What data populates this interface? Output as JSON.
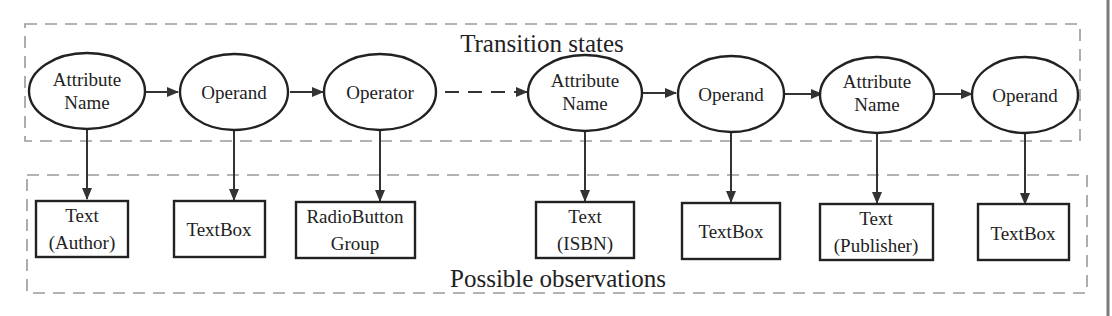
{
  "diagram": {
    "groups": {
      "transition": {
        "title": "Transition states"
      },
      "observation": {
        "title": "Possible observations"
      }
    },
    "states": [
      {
        "id": "s1",
        "lines": [
          "Attribute",
          "Name"
        ]
      },
      {
        "id": "s2",
        "lines": [
          "Operand"
        ]
      },
      {
        "id": "s3",
        "lines": [
          "Operator"
        ]
      },
      {
        "id": "s4",
        "lines": [
          "Attribute",
          "Name"
        ]
      },
      {
        "id": "s5",
        "lines": [
          "Operand"
        ]
      },
      {
        "id": "s6",
        "lines": [
          "Attribute",
          "Name"
        ]
      },
      {
        "id": "s7",
        "lines": [
          "Operand"
        ]
      }
    ],
    "observations": [
      {
        "id": "o1",
        "lines": [
          "Text",
          "(Author)"
        ]
      },
      {
        "id": "o2",
        "lines": [
          "TextBox"
        ]
      },
      {
        "id": "o3",
        "lines": [
          "RadioButton",
          "Group"
        ]
      },
      {
        "id": "o4",
        "lines": [
          "Text",
          "(ISBN)"
        ]
      },
      {
        "id": "o5",
        "lines": [
          "TextBox"
        ]
      },
      {
        "id": "o6",
        "lines": [
          "Text",
          "(Publisher)"
        ]
      },
      {
        "id": "o7",
        "lines": [
          "TextBox"
        ]
      }
    ],
    "transitions": [
      {
        "from": "s1",
        "to": "s2",
        "style": "solid"
      },
      {
        "from": "s2",
        "to": "s3",
        "style": "solid"
      },
      {
        "from": "s3",
        "to": "s4",
        "style": "dashed"
      },
      {
        "from": "s4",
        "to": "s5",
        "style": "solid"
      },
      {
        "from": "s5",
        "to": "s6",
        "style": "solid"
      },
      {
        "from": "s6",
        "to": "s7",
        "style": "solid"
      }
    ],
    "emissions": [
      {
        "from": "s1",
        "to": "o1"
      },
      {
        "from": "s2",
        "to": "o2"
      },
      {
        "from": "s3",
        "to": "o3"
      },
      {
        "from": "s4",
        "to": "o4"
      },
      {
        "from": "s5",
        "to": "o5"
      },
      {
        "from": "s6",
        "to": "o6"
      },
      {
        "from": "s7",
        "to": "o7"
      }
    ],
    "colors": {
      "stroke": "#222222",
      "group_border": "#9a9a9a",
      "background": "#ffffff"
    }
  }
}
